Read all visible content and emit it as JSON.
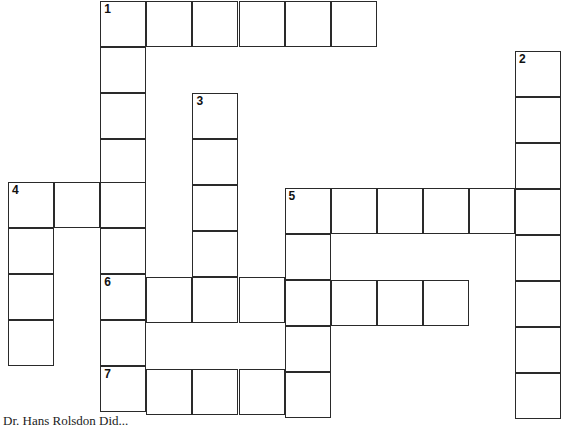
{
  "puzzle": {
    "type": "crossword",
    "cell_size_px": 46,
    "line_color": "#2a2a2a",
    "background": "#ffffff",
    "words": [
      {
        "number": "1",
        "direction": "across",
        "row": 0,
        "col": 2,
        "length": 6
      },
      {
        "number": "1",
        "direction": "down",
        "row": 0,
        "col": 2,
        "length": 9
      },
      {
        "number": "2",
        "direction": "down",
        "row": 1,
        "col": 11,
        "length": 8
      },
      {
        "number": "3",
        "direction": "down",
        "row": 2,
        "col": 4,
        "length": 5
      },
      {
        "number": "4",
        "direction": "across",
        "row": 4,
        "col": 0,
        "length": 3
      },
      {
        "number": "4",
        "direction": "down",
        "row": 4,
        "col": 0,
        "length": 4
      },
      {
        "number": "5",
        "direction": "across",
        "row": 4,
        "col": 6,
        "length": 6
      },
      {
        "number": "5",
        "direction": "down",
        "row": 4,
        "col": 6,
        "length": 5
      },
      {
        "number": "6",
        "direction": "across",
        "row": 6,
        "col": 2,
        "length": 8
      },
      {
        "number": "7",
        "direction": "across",
        "row": 8,
        "col": 2,
        "length": 5
      }
    ]
  },
  "footer": {
    "text": "Dr. Hans Rolsdon Did..."
  }
}
